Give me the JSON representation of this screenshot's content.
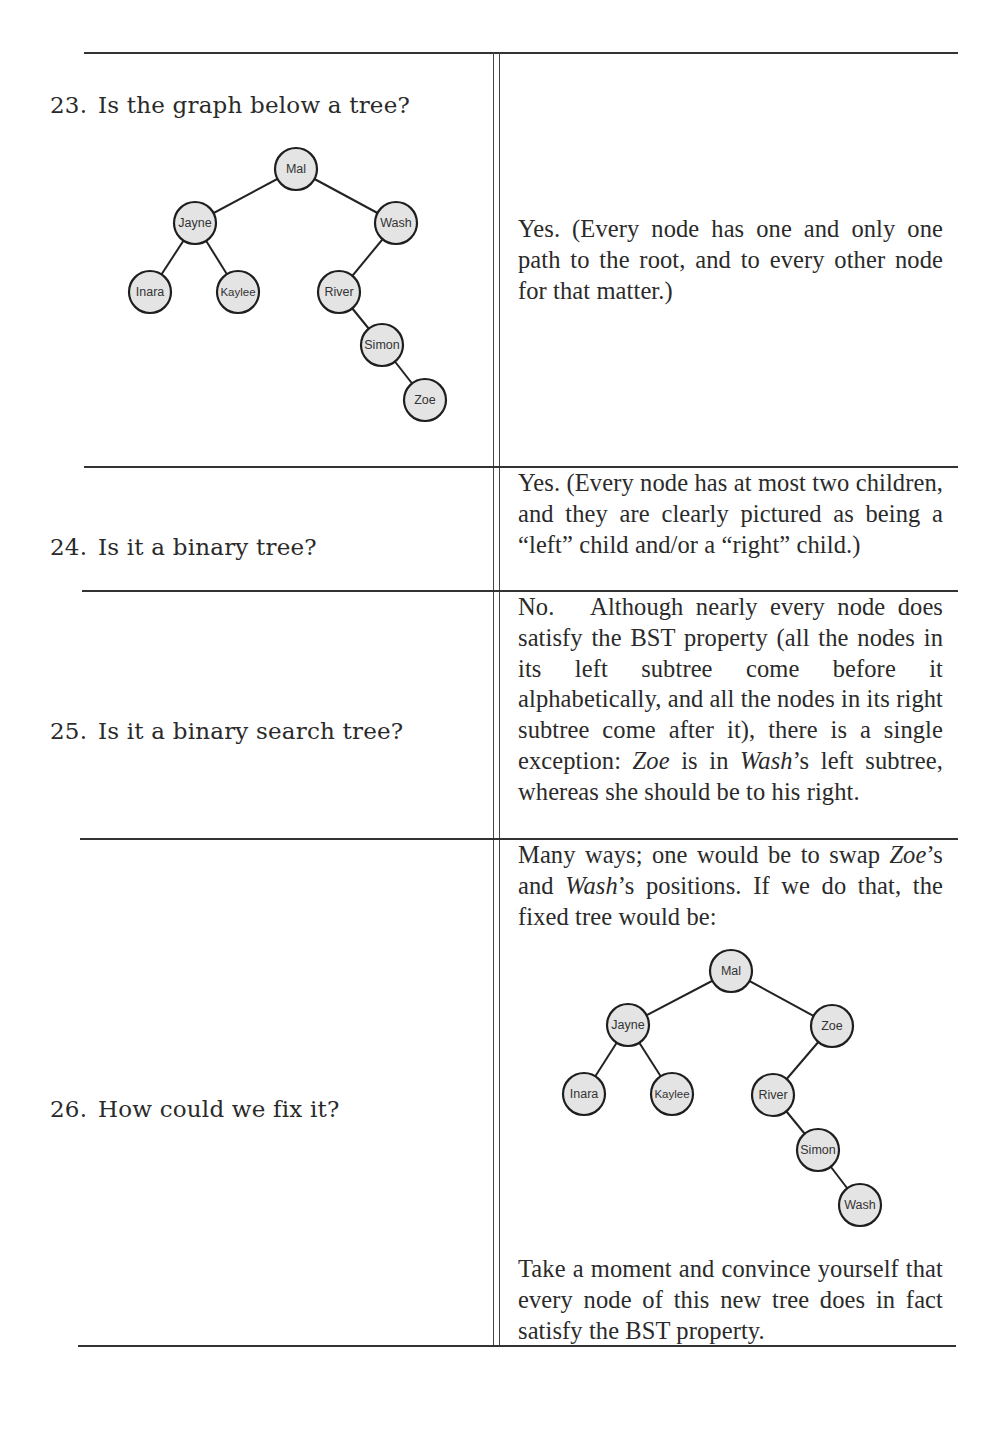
{
  "questions": [
    {
      "number": "23.",
      "text": "Is the graph below a tree?",
      "answer": "Yes. (Every node has one and only one path to the root, and to every other node for that matter.)",
      "tree": {
        "nodes": [
          {
            "id": "mal",
            "label": "Mal"
          },
          {
            "id": "jayne",
            "label": "Jayne"
          },
          {
            "id": "wash",
            "label": "Wash"
          },
          {
            "id": "inara",
            "label": "Inara"
          },
          {
            "id": "kaylee",
            "label": "Kaylee"
          },
          {
            "id": "river",
            "label": "River"
          },
          {
            "id": "simon",
            "label": "Simon"
          },
          {
            "id": "zoe",
            "label": "Zoe"
          }
        ],
        "edges": [
          [
            "mal",
            "jayne"
          ],
          [
            "mal",
            "wash"
          ],
          [
            "jayne",
            "inara"
          ],
          [
            "jayne",
            "kaylee"
          ],
          [
            "wash",
            "river"
          ],
          [
            "river",
            "simon"
          ],
          [
            "simon",
            "zoe"
          ]
        ]
      }
    },
    {
      "number": "24.",
      "text": "Is it a binary tree?",
      "answer": "Yes. (Every node has at most two children, and they are clearly pictured as being a “left” child and/or a “right” child.)"
    },
    {
      "number": "25.",
      "text": "Is it a binary search tree?",
      "answer_parts": {
        "p1": "No.   Although nearly every node does satisfy the BST property (all the nodes in its left subtree come before it alphabetically, and all the nodes in its right subtree come after it), there is a single exception: ",
        "zoe": "Zoe",
        "p2": " is in ",
        "wash": "Wash",
        "p3": "’s left subtree, whereas she should be to his right."
      }
    },
    {
      "number": "26.",
      "text": "How could we fix it?",
      "answer_parts": {
        "p1": "Many ways; one would be to swap ",
        "zoe": "Zoe",
        "p2": "’s and ",
        "wash": "Wash",
        "p3": "’s positions. If we do that, the fixed tree would be:"
      },
      "closing": "Take a moment and convince yourself that every node of this new tree does in fact satisfy the BST property.",
      "tree": {
        "nodes": [
          {
            "id": "mal",
            "label": "Mal"
          },
          {
            "id": "jayne",
            "label": "Jayne"
          },
          {
            "id": "zoe",
            "label": "Zoe"
          },
          {
            "id": "inara",
            "label": "Inara"
          },
          {
            "id": "kaylee",
            "label": "Kaylee"
          },
          {
            "id": "river",
            "label": "River"
          },
          {
            "id": "simon",
            "label": "Simon"
          },
          {
            "id": "wash",
            "label": "Wash"
          }
        ],
        "edges": [
          [
            "mal",
            "jayne"
          ],
          [
            "mal",
            "zoe"
          ],
          [
            "jayne",
            "inara"
          ],
          [
            "jayne",
            "kaylee"
          ],
          [
            "zoe",
            "river"
          ],
          [
            "river",
            "simon"
          ],
          [
            "simon",
            "wash"
          ]
        ]
      }
    }
  ]
}
